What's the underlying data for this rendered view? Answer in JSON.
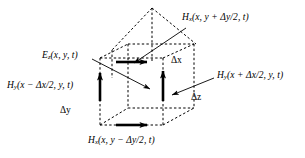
{
  "figure": {
    "type": "yee-cell-field-component-diagram",
    "background_color": "#ffffff",
    "line_color": "#000000",
    "dash_color": "#000000",
    "labels": {
      "h_top": {
        "symbol": "H",
        "subscript": "x",
        "args": "(x, y + Δy/2, t)",
        "text": "H x (x, y + Δy/2, t)"
      },
      "e_center": {
        "symbol": "E",
        "subscript": "z",
        "args": "(x, y, t)",
        "text": "E z (x, y, t)"
      },
      "h_left": {
        "symbol": "H",
        "subscript": "y",
        "args": "(x − Δx/2, y, t)",
        "text": "H y (x − Δx/2, y, t)"
      },
      "h_right": {
        "symbol": "H",
        "subscript": "y",
        "args": "(x + Δx/2, y, t)",
        "text": "H y (x + Δx/2, y, t)"
      },
      "h_bottom": {
        "symbol": "H",
        "subscript": "x",
        "args": "(x, y − Δy/2, t)",
        "text": "H x (x, y − Δy/2, t)"
      }
    },
    "dimensions": {
      "dx": "Δx",
      "dy": "Δy",
      "dz": "Δz"
    }
  }
}
